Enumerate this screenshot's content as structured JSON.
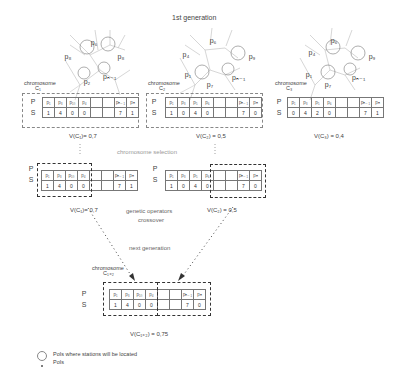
{
  "title": "1st generation",
  "parents": [
    {
      "label": "chromosome",
      "sub": "C₁",
      "P": [
        "p₁",
        "p₃",
        "p₁₀",
        "p₄",
        "",
        "",
        "pₙ₋₁",
        "pₙ"
      ],
      "S": [
        "1",
        "4",
        "0",
        "0",
        "",
        "",
        "7",
        "1"
      ],
      "value": "V(C₁)= 0,7",
      "points": [
        "p₆",
        "p₈",
        "p₂",
        "pₙ₋₁"
      ]
    },
    {
      "label": "chromosome",
      "sub": "C₂",
      "P": [
        "p₁",
        "p₃",
        "p₅",
        "p₆",
        "",
        "",
        "pₙ₋₁",
        "pₙ"
      ],
      "S": [
        "1",
        "0",
        "4",
        "0",
        "",
        "",
        "7",
        "0"
      ],
      "value": "V(C₂) = 0,5",
      "points": [
        "p₆",
        "p₄",
        "p₉",
        "p₁",
        "pₙ₋₁",
        "p₇"
      ]
    },
    {
      "label": "chromosome",
      "sub": "C₃",
      "P": [
        "p₁",
        "p₃",
        "p₅",
        "p₆",
        "",
        "",
        "pₙ₋₁",
        "pₙ"
      ],
      "S": [
        "0",
        "4",
        "2",
        "0",
        "",
        "",
        "7",
        "1"
      ],
      "value": "V(C₃) = 0,4",
      "points": [
        "p₆",
        "p₄",
        "p₉",
        "p₁",
        "pₙ₋₁",
        "p₇"
      ]
    }
  ],
  "selection_label": "chromosome selection",
  "selected": [
    {
      "P": [
        "p₁",
        "p₃",
        "p₁₀",
        "p₄",
        "",
        "",
        "pₙ₋₁",
        "pₙ"
      ],
      "S": [
        "1",
        "4",
        "0",
        "0",
        "",
        "",
        "7",
        "1"
      ],
      "value": "V(C₁)= 0,7"
    },
    {
      "P": [
        "p₁",
        "p₃",
        "p₅",
        "p₆",
        "",
        "",
        "pₙ₋₁",
        "pₙ"
      ],
      "S": [
        "1",
        "0",
        "4",
        "0",
        "",
        "",
        "7",
        "0"
      ],
      "value": "V(C₂) = 0,5"
    }
  ],
  "operators_label_1": "genetic operators",
  "operators_label_2": "crossover",
  "next_gen_label": "next generation",
  "child": {
    "label": "chromosome",
    "sub": "C₁₊₂",
    "P": [
      "p₁",
      "p₃",
      "p₁₀",
      "p₄",
      "",
      "",
      "pₙ₋₁",
      "pₙ"
    ],
    "S": [
      "1",
      "4",
      "0",
      "0",
      "",
      "",
      "7",
      "0"
    ],
    "value": "V(C₁₊₂) = 0,75"
  },
  "row_labels": {
    "P": "P",
    "S": "S"
  },
  "legend": [
    {
      "icon": "circle-icon",
      "label": "PoIs where stations will be located"
    },
    {
      "icon": "dot-icon",
      "label": "PoIs"
    }
  ]
}
